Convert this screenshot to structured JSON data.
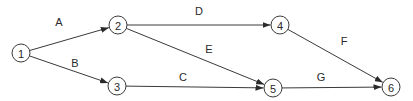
{
  "diagram": {
    "type": "activity-on-arrow network",
    "nodes": [
      {
        "id": "1",
        "label": "1",
        "x": 21,
        "y": 53
      },
      {
        "id": "2",
        "label": "2",
        "x": 118,
        "y": 25
      },
      {
        "id": "3",
        "label": "3",
        "x": 117,
        "y": 86
      },
      {
        "id": "4",
        "label": "4",
        "x": 280,
        "y": 25
      },
      {
        "id": "5",
        "label": "5",
        "x": 273,
        "y": 88
      },
      {
        "id": "6",
        "label": "6",
        "x": 391,
        "y": 87
      }
    ],
    "edges": [
      {
        "id": "A",
        "label": "A",
        "from": "1",
        "to": "2",
        "lx": 59,
        "ly": 22
      },
      {
        "id": "B",
        "label": "B",
        "from": "1",
        "to": "3",
        "lx": 75,
        "ly": 63
      },
      {
        "id": "C",
        "label": "C",
        "from": "3",
        "to": "5",
        "lx": 183,
        "ly": 77
      },
      {
        "id": "D",
        "label": "D",
        "from": "2",
        "to": "4",
        "lx": 199,
        "ly": 11
      },
      {
        "id": "E",
        "label": "E",
        "from": "2",
        "to": "5",
        "lx": 209,
        "ly": 49
      },
      {
        "id": "F",
        "label": "F",
        "from": "4",
        "to": "6",
        "lx": 344,
        "ly": 41
      },
      {
        "id": "G",
        "label": "G",
        "from": "5",
        "to": "6",
        "lx": 321,
        "ly": 77
      }
    ],
    "node_radius": 9,
    "colors": {
      "stroke": "#3a3a3a",
      "text": "#2a2a2a",
      "background": "#ffffff"
    }
  }
}
